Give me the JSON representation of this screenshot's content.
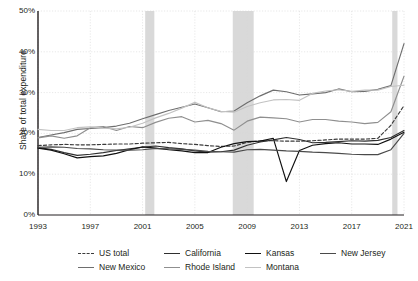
{
  "chart_data": {
    "type": "line",
    "title": "",
    "xlabel": "",
    "ylabel": "Share of total expenditure",
    "xlim": [
      1993,
      2021
    ],
    "ylim": [
      0,
      50
    ],
    "ytick_labels": [
      "0%",
      "10%",
      "20%",
      "30%",
      "40%",
      "50%"
    ],
    "ytick_values": [
      0,
      10,
      20,
      30,
      40,
      50
    ],
    "xtick_labels": [
      "1993",
      "1997",
      "2001",
      "2005",
      "2009",
      "2013",
      "2017",
      "2021"
    ],
    "xtick_values": [
      1993,
      1997,
      2001,
      2005,
      2009,
      2013,
      2017,
      2021
    ],
    "grid": true,
    "legend_position": "bottom",
    "x": [
      1993,
      1994,
      1995,
      1996,
      1997,
      1998,
      1999,
      2000,
      2001,
      2002,
      2003,
      2004,
      2005,
      2006,
      2007,
      2008,
      2009,
      2010,
      2011,
      2012,
      2013,
      2014,
      2015,
      2016,
      2017,
      2018,
      2019,
      2020,
      2021
    ],
    "recession_bands": [
      {
        "start": 2001.2,
        "end": 2001.9
      },
      {
        "start": 2007.9,
        "end": 2009.5
      },
      {
        "start": 2020.1,
        "end": 2020.5
      }
    ],
    "recession_color": "#d9d9d9",
    "series": [
      {
        "name": "US total",
        "color": "#3b3b3b",
        "style": "dashed",
        "values": [
          17.0,
          17.2,
          17.3,
          17.2,
          17.2,
          17.3,
          17.4,
          17.4,
          17.6,
          17.7,
          17.8,
          17.5,
          17.3,
          17.0,
          16.8,
          16.9,
          17.8,
          18.2,
          18.2,
          18.1,
          18.1,
          18.2,
          18.4,
          18.6,
          18.6,
          18.6,
          18.8,
          22.0,
          26.8
        ]
      },
      {
        "name": "California",
        "color": "#2f2f2f",
        "style": "solid",
        "values": [
          16.5,
          16.1,
          15.3,
          14.6,
          14.9,
          15.3,
          15.8,
          16.2,
          16.6,
          16.9,
          16.5,
          16.2,
          15.7,
          15.4,
          15.5,
          15.9,
          17.1,
          17.9,
          18.4,
          19.0,
          18.5,
          17.7,
          17.8,
          18.0,
          18.2,
          18.1,
          18.3,
          19.0,
          20.7
        ]
      },
      {
        "name": "Kansas",
        "color": "#111111",
        "style": "solid",
        "values": [
          16.4,
          15.9,
          15.0,
          14.0,
          14.3,
          14.5,
          15.1,
          16.0,
          16.7,
          16.4,
          16.0,
          15.7,
          15.3,
          15.3,
          16.6,
          17.5,
          18.0,
          18.1,
          18.8,
          8.2,
          15.8,
          17.1,
          17.5,
          17.7,
          17.4,
          17.4,
          17.3,
          18.6,
          20.3
        ]
      },
      {
        "name": "New Jersey",
        "color": "#4a4a4a",
        "style": "solid",
        "values": [
          16.6,
          16.7,
          16.6,
          16.3,
          16.2,
          16.0,
          15.9,
          15.9,
          16.0,
          16.3,
          16.2,
          16.1,
          15.9,
          15.6,
          15.5,
          15.4,
          16.0,
          16.1,
          15.9,
          15.7,
          15.6,
          15.4,
          15.3,
          15.1,
          14.9,
          14.8,
          14.8,
          16.0,
          20.0
        ]
      },
      {
        "name": "New Mexico",
        "color": "#6e6e6e",
        "style": "solid",
        "values": [
          19.0,
          19.6,
          20.2,
          21.0,
          21.2,
          21.4,
          21.8,
          22.5,
          23.6,
          24.6,
          25.6,
          26.4,
          27.2,
          26.3,
          25.3,
          25.5,
          27.5,
          29.2,
          30.6,
          30.2,
          29.4,
          29.7,
          30.0,
          30.9,
          30.2,
          30.3,
          30.8,
          31.7,
          42.0
        ]
      },
      {
        "name": "Rhode Island",
        "color": "#8f8f8f",
        "style": "solid",
        "values": [
          18.9,
          19.4,
          18.8,
          19.4,
          21.4,
          21.7,
          20.7,
          21.7,
          21.4,
          22.7,
          23.7,
          24.1,
          22.8,
          23.2,
          22.4,
          20.8,
          23.0,
          24.0,
          23.8,
          23.6,
          22.8,
          23.4,
          23.4,
          23.0,
          22.8,
          22.4,
          22.7,
          25.3,
          34.0
        ]
      },
      {
        "name": "Montana",
        "color": "#c2c2c2",
        "style": "solid",
        "values": [
          21.0,
          20.7,
          20.7,
          21.4,
          21.6,
          21.3,
          21.1,
          21.5,
          22.5,
          23.8,
          24.9,
          26.2,
          27.6,
          26.3,
          25.4,
          25.2,
          26.6,
          27.5,
          28.2,
          28.3,
          28.1,
          29.8,
          30.4,
          30.7,
          30.3,
          30.6,
          30.6,
          31.5,
          31.8
        ]
      }
    ]
  },
  "legend": {
    "row1": [
      {
        "name": "US total",
        "style": "dashed",
        "color": "#3b3b3b"
      },
      {
        "name": "California",
        "style": "solid",
        "color": "#2f2f2f"
      },
      {
        "name": "Kansas",
        "style": "solid",
        "color": "#111111"
      },
      {
        "name": "New Jersey",
        "style": "solid",
        "color": "#4a4a4a"
      }
    ],
    "row2": [
      {
        "name": "New Mexico",
        "style": "solid",
        "color": "#6e6e6e"
      },
      {
        "name": "Rhode Island",
        "style": "solid",
        "color": "#8f8f8f"
      },
      {
        "name": "Montana",
        "style": "solid",
        "color": "#c2c2c2"
      }
    ]
  }
}
